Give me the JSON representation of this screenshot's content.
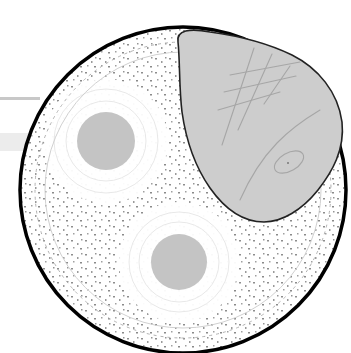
{
  "illustration": {
    "description": "Stylized circular cell-like cross-section with two gray nuclei and a gray blob overlapping the top-right",
    "colors": {
      "background": "#ffffff",
      "outline": "#000000",
      "nucleus": "#c4c4c4",
      "blob": "#cdcdcd",
      "blob_outline": "#222222",
      "scratch": "#a8a8a8",
      "speckle": "#8e8e8e",
      "band": "#e6e6e6",
      "band_line": "#c8c8c8"
    },
    "outer_circle": {
      "cx": 183,
      "cy": 190,
      "r": 164
    },
    "nuclei": [
      {
        "cx": 106,
        "cy": 141,
        "r": 29
      },
      {
        "cx": 179,
        "cy": 262,
        "r": 28
      }
    ]
  }
}
